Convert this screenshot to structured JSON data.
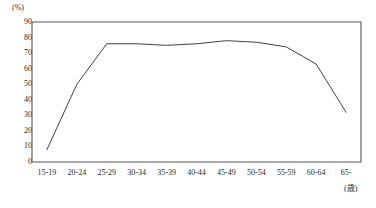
{
  "chart_data": {
    "type": "line",
    "title": "",
    "xlabel": "(歳)",
    "ylabel": "(%)",
    "categories": [
      "15-19",
      "20-24",
      "25-29",
      "30-34",
      "35-39",
      "40-44",
      "45-49",
      "50-54",
      "55-59",
      "60-64",
      "65-"
    ],
    "values": [
      8,
      50,
      76,
      76,
      75,
      76,
      78,
      77,
      74,
      63,
      32
    ],
    "ylim": [
      0,
      90
    ],
    "yticks": [
      90,
      80,
      70,
      60,
      50,
      40,
      30,
      20,
      10,
      0
    ],
    "grid": false,
    "legend": null,
    "series": [
      {
        "name": "",
        "values": [
          8,
          50,
          76,
          76,
          75,
          76,
          78,
          77,
          74,
          63,
          32
        ]
      }
    ],
    "line_color": "#404040"
  },
  "axes": {
    "y_unit_label": "(%)",
    "x_unit_label": "(歳)",
    "y_tick_labels": [
      "90",
      "80",
      "70",
      "60",
      "50",
      "40",
      "30",
      "20",
      "10",
      "0"
    ],
    "x_tick_labels": [
      "15-19",
      "20-24",
      "25-29",
      "30-34",
      "35-39",
      "40-44",
      "45-49",
      "50-54",
      "55-59",
      "60-64",
      "65-"
    ]
  },
  "style": {
    "frame_color": "#555555",
    "text_color": "#2a2a2a",
    "background": "#ffffff"
  }
}
